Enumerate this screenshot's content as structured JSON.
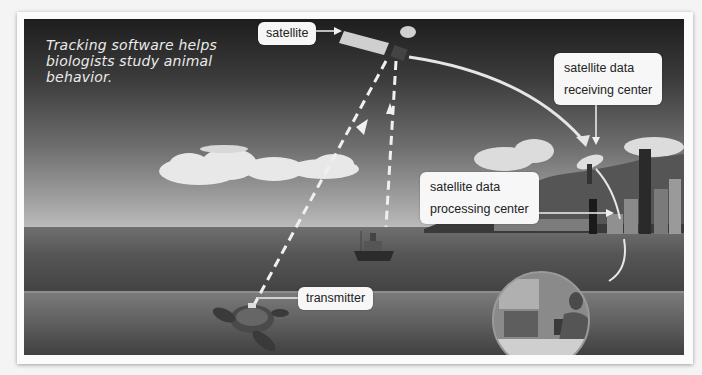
{
  "caption": "Tracking software helps biologists study animal behavior.",
  "labels": {
    "satellite": "satellite",
    "receiving_center_line1": "satellite data",
    "receiving_center_line2": "receiving center",
    "processing_center_line1": "satellite data",
    "processing_center_line2": "processing center",
    "transmitter": "transmitter"
  },
  "colors": {
    "label_bg": "#f7f7f7",
    "label_text": "#222222",
    "arrow": "#f0f0f0"
  }
}
